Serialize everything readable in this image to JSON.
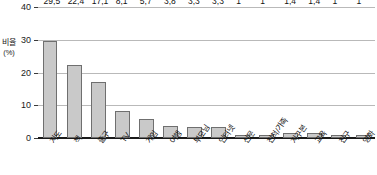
{
  "chart_data": {
    "type": "bar",
    "title": "",
    "xlabel": "",
    "ylabel": "비율",
    "yunit": "(%)",
    "ylim": [
      0,
      40
    ],
    "yticks": [
      0,
      10,
      20,
      30,
      40
    ],
    "grid": true,
    "legend": "none",
    "categories": [
      "지도",
      "책",
      "출구",
      "TV",
      "게임",
      "여행",
      "부모님",
      "인터넷",
      "신문",
      "친척/가족",
      "지구본",
      "교육",
      "친구",
      "영화"
    ],
    "values": [
      29.5,
      22.4,
      17.1,
      8.1,
      5.7,
      3.8,
      3.3,
      3.3,
      1,
      1,
      1.4,
      1.4,
      1,
      1
    ],
    "value_labels": [
      "29,5",
      "22,4",
      "17,1",
      "8,1",
      "5,7",
      "3,8",
      "3,3",
      "3,3",
      "1",
      "1",
      "1,4",
      "1,4",
      "1",
      "1"
    ],
    "tick_labels": [
      "0",
      "10",
      "20",
      "30",
      "40"
    ]
  },
  "style": {
    "bar_fill": "#c9c9c9",
    "bar_stroke": "#6f6f6f",
    "grid_color": "#b9b9b9",
    "axis_color": "#1a1a1a",
    "text_color": "#111111",
    "background": "#ffffff"
  }
}
